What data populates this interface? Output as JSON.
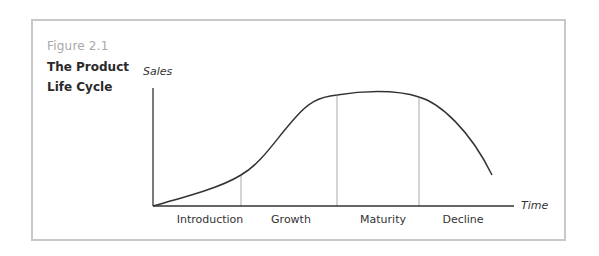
{
  "figure": {
    "number": "Figure 2.1",
    "title_line1": "The Product",
    "title_line2": "Life Cycle"
  },
  "axes": {
    "y_label": "Sales",
    "x_label": "Time"
  },
  "stages": [
    {
      "label": "Introduction"
    },
    {
      "label": "Growth"
    },
    {
      "label": "Maturity"
    },
    {
      "label": "Decline"
    }
  ],
  "colors": {
    "frame": "#c8c8c8",
    "curve": "#333333",
    "axis": "#333333",
    "divider": "#aaaaaa",
    "figure_number": "#a9a9a9",
    "title": "#2a2a2a"
  }
}
